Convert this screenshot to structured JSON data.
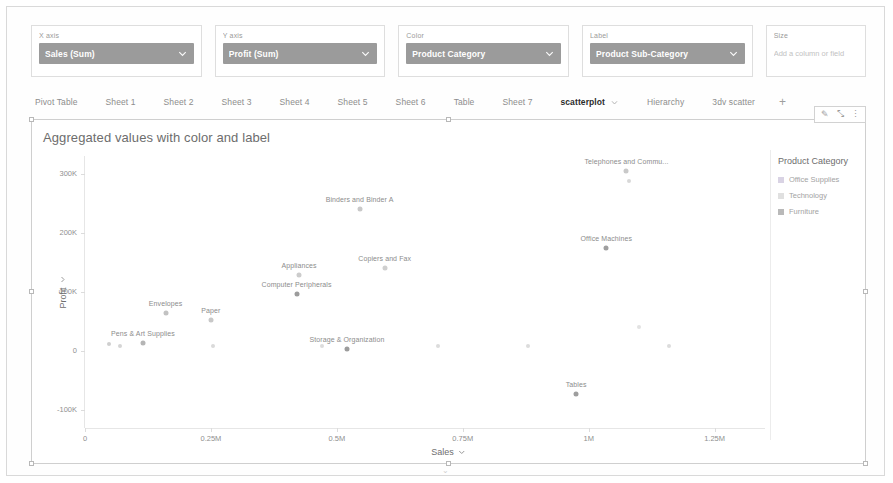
{
  "shelves": [
    {
      "name": "x-axis",
      "label": "X axis",
      "value": "Sales (Sum)",
      "type": "pill"
    },
    {
      "name": "y-axis",
      "label": "Y axis",
      "value": "Profit (Sum)",
      "type": "pill"
    },
    {
      "name": "color",
      "label": "Color",
      "value": "Product Category",
      "type": "pill"
    },
    {
      "name": "label",
      "label": "Label",
      "value": "Product Sub-Category",
      "type": "pill"
    },
    {
      "name": "size",
      "label": "Size",
      "value": "",
      "placeholder": "Add a column or field",
      "type": "empty"
    }
  ],
  "tabs": [
    {
      "label": "Pivot Table",
      "active": false
    },
    {
      "label": "Sheet 1",
      "active": false
    },
    {
      "label": "Sheet 2",
      "active": false
    },
    {
      "label": "Sheet 3",
      "active": false
    },
    {
      "label": "Sheet 4",
      "active": false
    },
    {
      "label": "Sheet 5",
      "active": false
    },
    {
      "label": "Sheet 6",
      "active": false
    },
    {
      "label": "Table",
      "active": false
    },
    {
      "label": "Sheet 7",
      "active": false
    },
    {
      "label": "scatterplot",
      "active": true
    },
    {
      "label": "Hierarchy",
      "active": false
    },
    {
      "label": "3dv scatter",
      "active": false
    }
  ],
  "tab_add_label": "+",
  "toolbar": {
    "edit_label": "✎",
    "expand_label": "⤡",
    "more_label": "⋮"
  },
  "page_caret": "⌄",
  "chart_data": {
    "type": "scatter",
    "title": "Aggregated values with color and label",
    "xlabel": "Sales",
    "ylabel": "Profit",
    "xlim": [
      0,
      1350000
    ],
    "ylim": [
      -130000,
      330000
    ],
    "xticks": [
      0,
      250000,
      500000,
      750000,
      1000000,
      1250000
    ],
    "xticklabels": [
      "0",
      "0.25M",
      "0.5M",
      "0.75M",
      "1M",
      "1.25M"
    ],
    "yticks": [
      -100000,
      0,
      100000,
      200000,
      300000
    ],
    "yticklabels": [
      "-100K",
      "0",
      "100K",
      "200K",
      "300K"
    ],
    "grid": false,
    "legend": {
      "title": "Product Category",
      "position": "right",
      "entries": [
        {
          "label": "Office Supplies",
          "color": "#d9d3e4"
        },
        {
          "label": "Technology",
          "color": "#e0e0e0"
        },
        {
          "label": "Furniture",
          "color": "#b9b9b9"
        }
      ]
    },
    "points": [
      {
        "label": "Telephones and Commu...",
        "x": 1075000,
        "y": 305000,
        "category": "Technology",
        "color": "#c9c9c9"
      },
      {
        "label": "Binders and Binder A",
        "x": 545000,
        "y": 240000,
        "category": "Office Supplies",
        "color": "#c9c9c9"
      },
      {
        "label": "Office Machines",
        "x": 1035000,
        "y": 175000,
        "category": "Technology",
        "color": "#9f9f9f"
      },
      {
        "label": "Copiers and Fax",
        "x": 595000,
        "y": 140000,
        "category": "Technology",
        "color": "#cfcfcf"
      },
      {
        "label": "Appliances",
        "x": 425000,
        "y": 128000,
        "category": "Office Supplies",
        "color": "#cccccc"
      },
      {
        "label": "Computer Peripherals",
        "x": 420000,
        "y": 97000,
        "category": "Technology",
        "color": "#9c9c9c"
      },
      {
        "label": "Envelopes",
        "x": 160000,
        "y": 65000,
        "category": "Office Supplies",
        "color": "#c2c2c2"
      },
      {
        "label": "Paper",
        "x": 250000,
        "y": 52000,
        "category": "Office Supplies",
        "color": "#c8c8c8"
      },
      {
        "label": "Pens & Art Supplies",
        "x": 115000,
        "y": 14000,
        "category": "Office Supplies",
        "color": "#b5b5b5"
      },
      {
        "label": "Storage & Organization",
        "x": 520000,
        "y": 4000,
        "category": "Office Supplies",
        "color": "#9c9c9c"
      },
      {
        "label": "Tables",
        "x": 975000,
        "y": -72000,
        "category": "Furniture",
        "color": "#9e9e9e"
      }
    ],
    "extra_marks": [
      {
        "x": 70000,
        "y": 9000,
        "color": "#d5d5d5"
      },
      {
        "x": 48000,
        "y": 12000,
        "color": "#cfcfcf"
      },
      {
        "x": 255000,
        "y": 9000,
        "color": "#dadada"
      },
      {
        "x": 470000,
        "y": 9000,
        "color": "#dcdcdc"
      },
      {
        "x": 700000,
        "y": 9000,
        "color": "#dcdcdc"
      },
      {
        "x": 880000,
        "y": 9000,
        "color": "#dcdcdc"
      },
      {
        "x": 1160000,
        "y": 9000,
        "color": "#dcdcdc"
      },
      {
        "x": 1100000,
        "y": 40000,
        "color": "#e2e2e2"
      },
      {
        "x": 1080000,
        "y": 288000,
        "color": "#d8d8d8"
      }
    ]
  }
}
